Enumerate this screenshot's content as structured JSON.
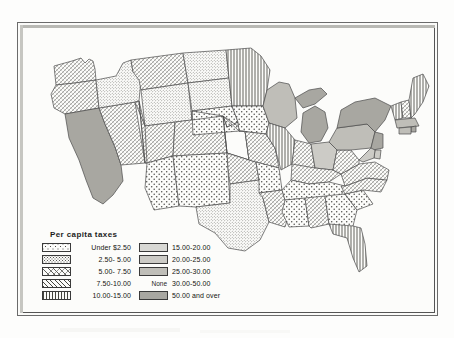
{
  "map": {
    "title": "Per capita taxes",
    "legend_title": "Per capita taxes",
    "none_label": "None",
    "legend": {
      "left_column": [
        {
          "label": "Under $2.50",
          "pattern": "coarse-stipple"
        },
        {
          "label": "2.50-  5.00",
          "pattern": "fine-stipple"
        },
        {
          "label": "5.00-  7.50",
          "pattern": "cross-hatch"
        },
        {
          "label": "7.50-10.00",
          "pattern": "diagonal-lines"
        },
        {
          "label": "10.00-15.00",
          "pattern": "vertical-lines"
        }
      ],
      "right_column": [
        {
          "label": "15.00-20.00",
          "pattern": "solid-gray-1",
          "color": "#d8d8d4"
        },
        {
          "label": "20.00-25.00",
          "pattern": "solid-gray-2",
          "color": "#cccbc6"
        },
        {
          "label": "25.00-30.00",
          "pattern": "solid-gray-3",
          "color": "#bfbeb8"
        },
        {
          "label": "30.00-50.00",
          "pattern": "none",
          "color": "none"
        },
        {
          "label": "50.00 and over",
          "pattern": "solid-gray-4",
          "color": "#a8a7a1"
        }
      ]
    },
    "colors": {
      "paper": "#fdfdfc",
      "ink": "#2b2b2b",
      "frame": "#6b6b6b",
      "state_outline": "#4a4a4a"
    },
    "states": [
      {
        "code": "WA",
        "pattern": "cross-hatch"
      },
      {
        "code": "OR",
        "pattern": "cross-hatch"
      },
      {
        "code": "CA",
        "pattern": "solid-gray-4"
      },
      {
        "code": "NV",
        "pattern": "cross-hatch"
      },
      {
        "code": "ID",
        "pattern": "fine-stipple"
      },
      {
        "code": "MT",
        "pattern": "cross-hatch"
      },
      {
        "code": "WY",
        "pattern": "fine-stipple"
      },
      {
        "code": "UT",
        "pattern": "cross-hatch"
      },
      {
        "code": "AZ",
        "pattern": "coarse-stipple"
      },
      {
        "code": "CO",
        "pattern": "cross-hatch"
      },
      {
        "code": "NM",
        "pattern": "coarse-stipple"
      },
      {
        "code": "ND",
        "pattern": "fine-stipple"
      },
      {
        "code": "SD",
        "pattern": "fine-stipple"
      },
      {
        "code": "NE",
        "pattern": "coarse-stipple"
      },
      {
        "code": "KS",
        "pattern": "coarse-stipple"
      },
      {
        "code": "OK",
        "pattern": "cross-hatch"
      },
      {
        "code": "TX",
        "pattern": "fine-stipple"
      },
      {
        "code": "MN",
        "pattern": "vertical-lines"
      },
      {
        "code": "IA",
        "pattern": "coarse-stipple"
      },
      {
        "code": "MO",
        "pattern": "cross-hatch"
      },
      {
        "code": "AR",
        "pattern": "coarse-stipple"
      },
      {
        "code": "LA",
        "pattern": "cross-hatch"
      },
      {
        "code": "WI",
        "pattern": "solid-gray-3"
      },
      {
        "code": "IL",
        "pattern": "vertical-lines"
      },
      {
        "code": "MI",
        "pattern": "solid-gray-4"
      },
      {
        "code": "IN",
        "pattern": "cross-hatch"
      },
      {
        "code": "OH",
        "pattern": "solid-gray-2"
      },
      {
        "code": "KY",
        "pattern": "cross-hatch"
      },
      {
        "code": "TN",
        "pattern": "coarse-stipple"
      },
      {
        "code": "MS",
        "pattern": "coarse-stipple"
      },
      {
        "code": "AL",
        "pattern": "cross-hatch"
      },
      {
        "code": "GA",
        "pattern": "coarse-stipple"
      },
      {
        "code": "FL",
        "pattern": "vertical-lines"
      },
      {
        "code": "SC",
        "pattern": "coarse-stipple"
      },
      {
        "code": "NC",
        "pattern": "cross-hatch"
      },
      {
        "code": "VA",
        "pattern": "cross-hatch"
      },
      {
        "code": "WV",
        "pattern": "cross-hatch"
      },
      {
        "code": "PA",
        "pattern": "solid-gray-3"
      },
      {
        "code": "NY",
        "pattern": "solid-gray-4"
      },
      {
        "code": "VT",
        "pattern": "vertical-lines"
      },
      {
        "code": "NH",
        "pattern": "cross-hatch"
      },
      {
        "code": "ME",
        "pattern": "vertical-lines"
      },
      {
        "code": "MA",
        "pattern": "solid-gray-3"
      },
      {
        "code": "RI",
        "pattern": "solid-gray-4"
      },
      {
        "code": "CT",
        "pattern": "solid-gray-3"
      },
      {
        "code": "NJ",
        "pattern": "solid-gray-4"
      },
      {
        "code": "DE",
        "pattern": "solid-gray-2"
      },
      {
        "code": "MD",
        "pattern": "solid-gray-2"
      }
    ]
  }
}
